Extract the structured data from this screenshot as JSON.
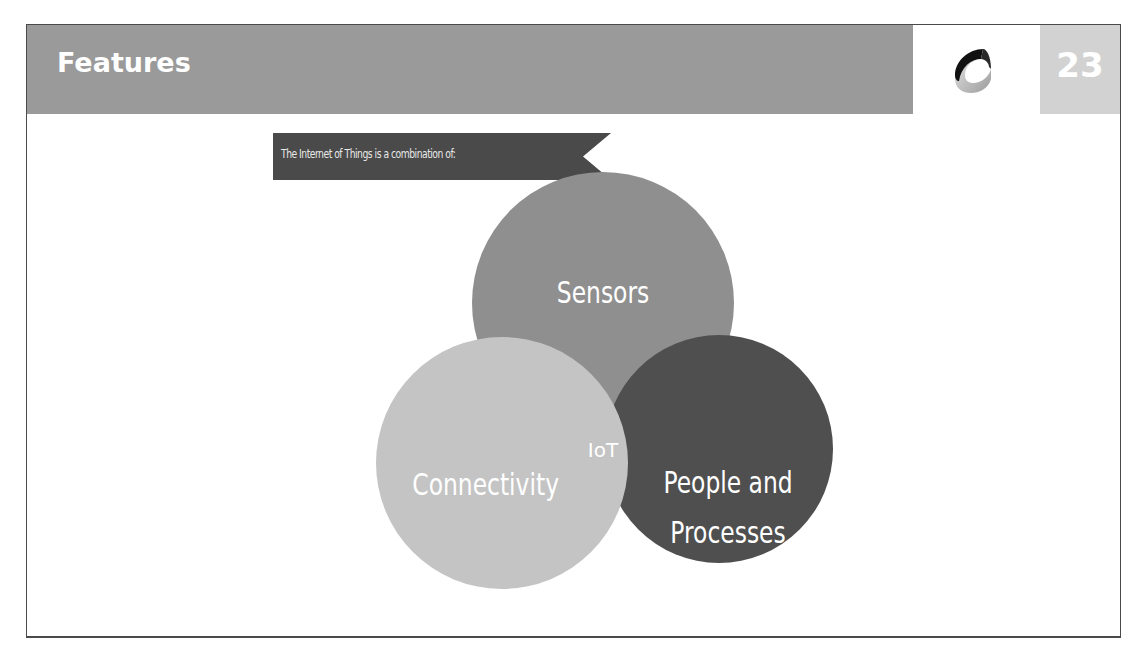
{
  "slide": {
    "title": "Features",
    "page_number": "23",
    "logo_icon": "c-ring-logo-icon"
  },
  "ribbon": {
    "text": "The Internet of Things is a combination of:"
  },
  "diagram": {
    "type": "venn",
    "center_label": "IoT",
    "circles": [
      {
        "label": "Sensors",
        "color": "#8f8f8f"
      },
      {
        "label": "Connectivity",
        "color": "#c4c4c4"
      },
      {
        "label_line1": "People and",
        "label_line2": "Processes",
        "color": "#4f4f4f"
      }
    ]
  },
  "colors": {
    "title_bar": "#9a9a9a",
    "page_box": "#d2d2d2",
    "ribbon": "#4a4a4a",
    "frame": "#4a4a4a"
  }
}
